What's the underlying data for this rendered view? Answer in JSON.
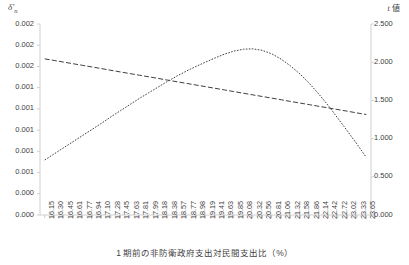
{
  "axes": {
    "left_title": "δ'n",
    "left_title_base": "δ",
    "left_title_sub": "n",
    "right_title": "t 値",
    "right_title_ital": "t",
    "right_title_rest": " 値",
    "x_title": "1 期前の非防衛政府支出対民間支出比（%）"
  },
  "chart_data": {
    "type": "line",
    "title": "",
    "xlabel": "1 期前の非防衛政府支出対民間支出比（%）",
    "ylabel": "δ'n",
    "y2label": "t 値",
    "grid": false,
    "legend": "none",
    "ylim": [
      0.0,
      0.002
    ],
    "y2lim": [
      0.0,
      2.5
    ],
    "y_ticks": [
      "0.002",
      "0.002",
      "0.002",
      "0.001",
      "0.001",
      "0.001",
      "0.001",
      "0.001",
      "0.000",
      "0.000"
    ],
    "y_tick_values": [
      0.002,
      0.00178,
      0.00156,
      0.00133,
      0.00111,
      0.00089,
      0.00067,
      0.00044,
      0.00022,
      0.0
    ],
    "y2_ticks": [
      "2.500",
      "2.000",
      "1.500",
      "1.000",
      "0.500",
      "0.000"
    ],
    "y2_tick_values": [
      2.5,
      2.0,
      1.5,
      1.0,
      0.5,
      0.0
    ],
    "categories": [
      "16.15",
      "16.30",
      "16.45",
      "16.61",
      "16.77",
      "16.94",
      "17.10",
      "17.28",
      "17.45",
      "17.63",
      "17.81",
      "17.99",
      "18.18",
      "18.38",
      "18.57",
      "18.77",
      "18.98",
      "19.19",
      "19.41",
      "19.63",
      "19.85",
      "20.08",
      "20.32",
      "20.56",
      "20.81",
      "21.06",
      "21.32",
      "21.58",
      "21.86",
      "22.14",
      "22.42",
      "22.72",
      "23.02",
      "23.33",
      "23.65"
    ],
    "series": [
      {
        "name": "δ'n",
        "axis": "left",
        "style": "dashed",
        "color": "#3f3f3f",
        "values": [
          0.001635,
          0.001618,
          0.001601,
          0.001584,
          0.001567,
          0.00155,
          0.001533,
          0.001515,
          0.001498,
          0.001481,
          0.001464,
          0.001447,
          0.00143,
          0.001412,
          0.001395,
          0.001378,
          0.001361,
          0.001344,
          0.001327,
          0.00131,
          0.001292,
          0.001275,
          0.001258,
          0.001241,
          0.001224,
          0.001207,
          0.001189,
          0.001172,
          0.001155,
          0.001138,
          0.001121,
          0.001104,
          0.001087,
          0.001069,
          0.001052
        ]
      },
      {
        "name": "t 値",
        "axis": "right",
        "style": "dotted",
        "color": "#3f3f3f",
        "values": [
          0.72,
          0.8,
          0.88,
          0.96,
          1.04,
          1.12,
          1.2,
          1.285,
          1.365,
          1.445,
          1.525,
          1.6,
          1.675,
          1.75,
          1.82,
          1.885,
          1.945,
          2.0,
          2.055,
          2.105,
          2.145,
          2.17,
          2.175,
          2.155,
          2.11,
          2.04,
          1.95,
          1.845,
          1.72,
          1.58,
          1.43,
          1.265,
          1.1,
          0.93,
          0.755
        ]
      }
    ]
  }
}
